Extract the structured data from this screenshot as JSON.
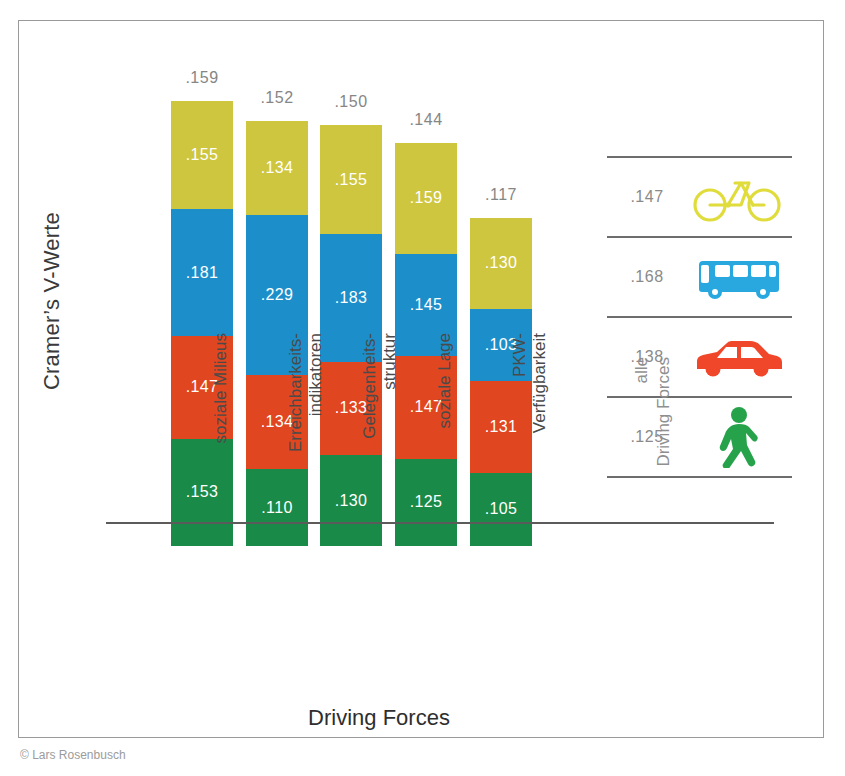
{
  "figure": {
    "y_axis_title": "Cramer’s V-Werte",
    "x_axis_title": "Driving Forces",
    "caption": "© Lars Rosenbusch"
  },
  "legend": {
    "axis_label_line1": "alle",
    "axis_label_line2": "Driving Forces",
    "rows": [
      {
        "value": ".147",
        "icon": "bicycle-icon",
        "color": "#e0dc3c"
      },
      {
        "value": ".168",
        "icon": "bus-icon",
        "color": "#29a8e0"
      },
      {
        "value": ".138",
        "icon": "car-icon",
        "color": "#f0462a"
      },
      {
        "value": ".125",
        "icon": "pedestrian-icon",
        "color": "#26a34a"
      }
    ]
  },
  "colors": {
    "bicycle_yellow": "#cfc63f",
    "bus_blue": "#1c8fcb",
    "car_red": "#e0461f",
    "pedestrian_green": "#1a8a48",
    "axis": "#5b5b5b",
    "frame": "#9a9a9a",
    "label_gray": "#868686"
  },
  "chart_data": {
    "type": "bar",
    "title": "",
    "xlabel": "Driving Forces",
    "ylabel": "Cramer’s V-Werte",
    "stacked": true,
    "grid": false,
    "legend_position": "right",
    "categories": [
      "soziale Milieus",
      "Erreichbarkeits-indikatoren",
      "Gelegenheits-struktur",
      "soziale Lage",
      "PKW-Verfügbarkeit"
    ],
    "category_lines": [
      [
        "soziale Milieus",
        ""
      ],
      [
        "Erreichbarkeits-",
        "indikatoren"
      ],
      [
        "Gelegenheits-",
        "struktur"
      ],
      [
        "soziale Lage",
        ""
      ],
      [
        "PKW-",
        "Verfügbarkeit"
      ]
    ],
    "series": [
      {
        "name": "Fahrrad (bicycle)",
        "color": "#cfc63f",
        "values": [
          0.155,
          0.134,
          0.155,
          0.159,
          0.13
        ],
        "labels": [
          ".155",
          ".134",
          ".155",
          ".159",
          ".130"
        ]
      },
      {
        "name": "Bus (public transport)",
        "color": "#1c8fcb",
        "values": [
          0.181,
          0.229,
          0.183,
          0.145,
          0.103
        ],
        "labels": [
          ".181",
          ".229",
          ".183",
          ".145",
          ".103"
        ]
      },
      {
        "name": "PKW (car)",
        "color": "#e0461f",
        "values": [
          0.147,
          0.134,
          0.133,
          0.147,
          0.131
        ],
        "labels": [
          ".147",
          ".134",
          ".133",
          ".147",
          ".131"
        ]
      },
      {
        "name": "zu Fuß (pedestrian)",
        "color": "#1a8a48",
        "values": [
          0.153,
          0.11,
          0.13,
          0.125,
          0.105
        ],
        "labels": [
          ".153",
          ".110",
          ".130",
          ".125",
          ".105"
        ]
      }
    ],
    "totals_mean_labels": [
      ".159",
      ".152",
      ".150",
      ".144",
      ".117"
    ],
    "totals_mean_values": [
      0.159,
      0.152,
      0.15,
      0.144,
      0.117
    ],
    "legend_values": [
      0.147,
      0.168,
      0.138,
      0.125
    ],
    "legend_labels": [
      ".147",
      ".168",
      ".138",
      ".125"
    ],
    "legend_names": [
      "Fahrrad",
      "Bus",
      "PKW",
      "zu Fuß"
    ],
    "ylim": [
      0,
      0.68
    ]
  },
  "bar_layout": {
    "left_positions": [
      65,
      140,
      214,
      289,
      364
    ],
    "px_per_unit": 700
  }
}
